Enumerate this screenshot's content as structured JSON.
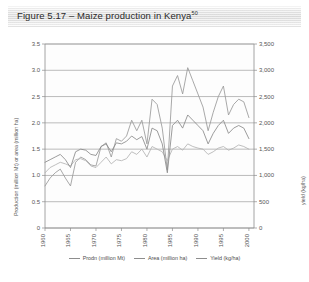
{
  "figure": {
    "title": "Figure 5.17 – Maize production in Kenya",
    "footnote_marker": "50"
  },
  "chart_data": {
    "type": "line",
    "title": "Maize production in Kenya",
    "xlabel": "",
    "ylabel": "Production (million Mt) or area (million ha)",
    "y2label": "yield (kg/ha)",
    "grid": true,
    "legend_position": "bottom",
    "xlim": [
      1960,
      2001
    ],
    "ylim": [
      0,
      3.5
    ],
    "y2lim": [
      0,
      3500
    ],
    "xticks": [
      "1960",
      "1965",
      "1970",
      "1975",
      "1980",
      "1985",
      "1990",
      "1995",
      "2000"
    ],
    "yticks": [
      "0",
      "0.5",
      "1.0",
      "1.5",
      "2.0",
      "2.5",
      "3.0",
      "3.5"
    ],
    "y2ticks": [
      "0",
      "500",
      "1,000",
      "1,500",
      "2,000",
      "2,500",
      "3,000",
      "3,500"
    ],
    "colors": {
      "prodn": "#9a9a9a",
      "area": "#b4b4b4",
      "yield": "#8a8a8a",
      "grid": "#9e9e9e",
      "frame": "#8d8d8d"
    },
    "x": [
      1960,
      1961,
      1962,
      1963,
      1964,
      1965,
      1966,
      1967,
      1968,
      1969,
      1970,
      1971,
      1972,
      1973,
      1974,
      1975,
      1976,
      1977,
      1978,
      1979,
      1980,
      1981,
      1982,
      1983,
      1984,
      1985,
      1986,
      1987,
      1988,
      1989,
      1990,
      1991,
      1992,
      1993,
      1994,
      1995,
      1996,
      1997,
      1998,
      1999,
      2000
    ],
    "series": [
      {
        "name": "Prodn (million Mt)",
        "axis": "left",
        "unit": "million Mt",
        "values": [
          0.8,
          0.95,
          1.05,
          1.12,
          0.95,
          0.8,
          1.25,
          1.35,
          1.3,
          1.2,
          1.18,
          1.55,
          1.62,
          1.35,
          1.7,
          1.65,
          1.75,
          2.05,
          1.85,
          2.05,
          1.6,
          2.45,
          2.35,
          1.9,
          1.1,
          2.7,
          2.9,
          2.55,
          3.05,
          2.8,
          2.55,
          2.3,
          1.85,
          2.2,
          2.5,
          2.7,
          2.15,
          2.35,
          2.45,
          2.4,
          2.1
        ]
      },
      {
        "name": "Area (million ha)",
        "axis": "left",
        "unit": "million ha",
        "values": [
          1.05,
          1.15,
          1.2,
          1.25,
          1.22,
          1.18,
          1.3,
          1.32,
          1.28,
          1.18,
          1.15,
          1.25,
          1.35,
          1.22,
          1.3,
          1.28,
          1.32,
          1.45,
          1.4,
          1.5,
          1.35,
          1.55,
          1.5,
          1.45,
          1.28,
          1.5,
          1.55,
          1.48,
          1.6,
          1.55,
          1.52,
          1.5,
          1.4,
          1.45,
          1.52,
          1.55,
          1.48,
          1.52,
          1.58,
          1.55,
          1.5
        ]
      },
      {
        "name": "Yield (kg/ha)",
        "axis": "right",
        "unit": "kg/ha",
        "values": [
          1250,
          1300,
          1350,
          1400,
          1300,
          1150,
          1450,
          1500,
          1480,
          1400,
          1380,
          1550,
          1600,
          1450,
          1620,
          1600,
          1650,
          1750,
          1680,
          1740,
          1500,
          1900,
          1850,
          1600,
          1050,
          1950,
          2050,
          1900,
          2150,
          2050,
          1950,
          1850,
          1600,
          1800,
          1950,
          2050,
          1800,
          1900,
          1950,
          1900,
          1700
        ]
      }
    ]
  },
  "legend": {
    "items": [
      {
        "label": "Prodn (million Mt)"
      },
      {
        "label": "Area (million ha)"
      },
      {
        "label": "Yield (kg/ha)"
      }
    ]
  }
}
